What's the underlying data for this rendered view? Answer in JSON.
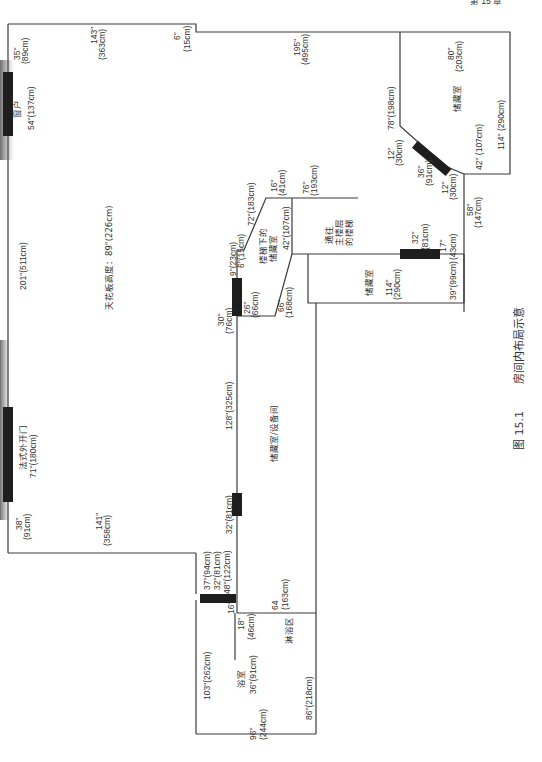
{
  "figure": {
    "caption_number": "图 15.1",
    "caption_title": "房间内布局示意",
    "header_fragment": "第 15 章"
  },
  "rooms": {
    "main_room": {
      "ceiling_height": "天花板高度：89\"(226cm)"
    },
    "window": {
      "label": "窗户",
      "size": "54\"(137cm)"
    },
    "french_door": {
      "label": "法式外开门",
      "size": "71\"(180cm)"
    },
    "storage_top_right": {
      "label": "储藏室"
    },
    "under_stair_storage": {
      "label_line1": "楼梯下的",
      "label_line2": "储藏室"
    },
    "stairs_to_main": {
      "label_line1": "通往",
      "label_line2": "主楼层",
      "label_line3": "的楼梯"
    },
    "storage_mid": {
      "label": "储藏室"
    },
    "storage_utility": {
      "label": "储藏室/设备间"
    },
    "bathroom": {
      "label": "浴室"
    },
    "shower": {
      "label": "淋浴区"
    }
  },
  "dimensions": {
    "d_35": "35\"",
    "d_89cm": "(89cm)",
    "d_143": "143\"",
    "d_363cm": "(363cm)",
    "d_6": "6\"",
    "d_15cm": "(15cm)",
    "d_195": "195\"",
    "d_495cm": "(495cm)",
    "d_201": "201\"(511cm)",
    "d_38": "38\"",
    "d_91cm": "(91cm)",
    "d_141": "141\"",
    "d_358cm": "(358cm)",
    "d_78_198": "78\"(198cm)",
    "d_80": "80\"",
    "d_203cm": "(203cm)",
    "d_114_290": "114\" (290cm)",
    "d_12a": "12\"",
    "d_30cm_a": "(30cm)",
    "d_36": "36\"",
    "d_91cm_b": "(91cm)",
    "d_12b": "12\"",
    "d_30cm_b": "(30cm)",
    "d_42_107_right": "42\" (107cm)",
    "d_58": "58\"",
    "d_147cm": "(147cm)",
    "d_17": "17\"",
    "d_43cm": "(43cm)",
    "d_39_99": "39\"(99cm)",
    "d_32a": "32\"",
    "d_81cm_a": "(81cm)",
    "d_114b": "114\"",
    "d_290cm_b": "(290cm)",
    "d_16a": "16\"",
    "d_41cm": "(41cm)",
    "d_76": "76\"",
    "d_193cm": "(193cm)",
    "d_72_183": "72\"(183cm)",
    "d_9_23": "9\"(23cm)",
    "d_6_15": "6\"(15cm)",
    "d_42_107_mid": "42\"(107cm)",
    "d_30": "30\"",
    "d_76cm": "(76cm)",
    "d_26": "26\"",
    "d_66cm": "(66cm)",
    "d_66": "66\"",
    "d_168cm": "(168cm)",
    "d_128_325": "128\"(325cm)",
    "d_32_81_mid": "32\"(81cm)",
    "d_37_94": "37\"(94cm)",
    "d_32_81_low": "32\"(81cm)",
    "d_48_122": "48\"(122cm)",
    "d_64": "64",
    "d_163cm": "(163cm)",
    "d_16b": "16\"",
    "d_18": "18\"",
    "d_46cm": "(46cm)",
    "d_36_91": "36\"(91cm)",
    "d_103_262": "103\"(262cm)",
    "d_96": "96\"",
    "d_244cm": "(244cm)",
    "d_86_218": "86\"(218cm)"
  },
  "colors": {
    "wall": "#3a3a3a",
    "door": "#1e1e1e",
    "text": "#333333",
    "background": "#ffffff"
  }
}
